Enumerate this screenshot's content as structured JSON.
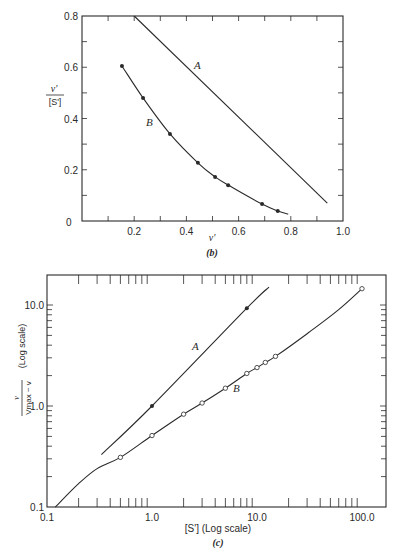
{
  "chart_data": [
    {
      "id": "b",
      "type": "line",
      "caption": "(b)",
      "title": "",
      "xlabel": "v'",
      "ylabel": "v' / [S']",
      "xlim": [
        0,
        1.0
      ],
      "ylim": [
        0,
        0.8
      ],
      "x_ticks": [
        "0",
        "0.2",
        "0.4",
        "0.6",
        "0.8",
        "1.0"
      ],
      "y_ticks": [
        "0.2",
        "0.4",
        "0.6",
        "0.8"
      ],
      "grid": false,
      "legend": "none (curves labeled inline)",
      "series": [
        {
          "name": "A",
          "markers": false,
          "x": [
            0.2,
            0.94
          ],
          "y": [
            0.8,
            0.07
          ]
        },
        {
          "name": "B",
          "markers": "filled",
          "x": [
            0.153,
            0.234,
            0.337,
            0.444,
            0.51,
            0.56,
            0.69,
            0.75,
            0.79
          ],
          "y": [
            0.605,
            0.48,
            0.34,
            0.227,
            0.172,
            0.14,
            0.066,
            0.039,
            0.027
          ],
          "marker_points": 8
        }
      ]
    },
    {
      "id": "c",
      "type": "line",
      "caption": "(c)",
      "title": "",
      "xlabel": "[S'] (Log scale)",
      "ylabel": "v / (Vmax − v)  (Log scale)",
      "xscale": "log",
      "yscale": "log",
      "xlim": [
        0.1,
        165
      ],
      "ylim": [
        0.1,
        20
      ],
      "x_ticks": [
        "0.1",
        "1.0",
        "10.0",
        "100.0"
      ],
      "y_ticks": [
        "0.1",
        "1.0",
        "10.0"
      ],
      "grid": false,
      "legend": "none (curves labeled inline)",
      "series": [
        {
          "name": "A",
          "markers": "filled",
          "x": [
            0.33,
            1.0,
            8.0,
            13.0
          ],
          "y": [
            0.33,
            1.0,
            9.3,
            15.0
          ],
          "marker_indices": [
            1,
            2
          ]
        },
        {
          "name": "B",
          "markers": "open",
          "x": [
            0.12,
            0.2,
            0.3,
            0.5,
            1.0,
            2.0,
            3.0,
            5.0,
            8.0,
            10.0,
            12.0,
            15.0,
            30.0,
            60.0,
            100.0
          ],
          "y": [
            0.1,
            0.17,
            0.24,
            0.31,
            0.51,
            0.83,
            1.07,
            1.5,
            2.1,
            2.4,
            2.7,
            3.1,
            5.2,
            9.0,
            14.5
          ],
          "marker_indices": [
            3,
            4,
            5,
            6,
            7,
            8,
            9,
            10,
            11,
            14
          ]
        }
      ]
    }
  ],
  "labels": {
    "b": {
      "y_num": "v'",
      "y_den": "[S']",
      "x": "v'",
      "caption": "(b)",
      "curve_a": "A",
      "curve_b": "B",
      "origin": "0"
    },
    "c": {
      "y_num": "v",
      "y_den": "Vmax − v",
      "y_scale": "(Log scale)",
      "x": "[S'] (Log scale)",
      "caption": "(c)",
      "curve_a": "A",
      "curve_b": "B"
    }
  },
  "colors": {
    "ink": "#2a2a2a",
    "background": "#ffffff"
  }
}
